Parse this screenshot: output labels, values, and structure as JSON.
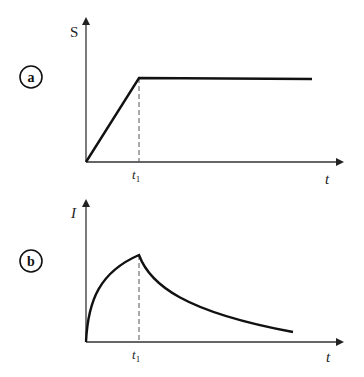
{
  "panels": [
    {
      "id": "a",
      "badge": "a",
      "y_axis_label": "S",
      "x_axis_label": "t",
      "marker_label": "t",
      "marker_sub": "1",
      "description": "S rises linearly from 0 until t1, then stays constant"
    },
    {
      "id": "b",
      "badge": "b",
      "y_axis_label": "I",
      "x_axis_label": "t",
      "marker_label": "t",
      "marker_sub": "1",
      "description": "I rises concavely from 0 to a peak at t1, then decays exponentially"
    }
  ],
  "colors": {
    "line": "#111111",
    "axis": "#333333",
    "dashed": "#555555",
    "background": "#ffffff"
  }
}
